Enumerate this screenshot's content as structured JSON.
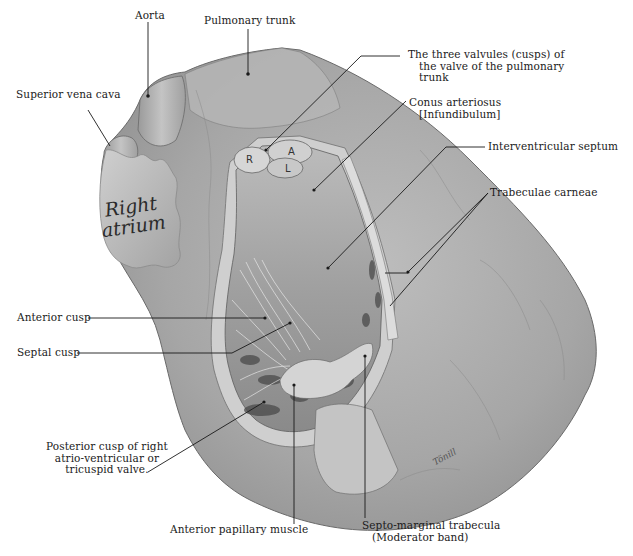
{
  "figure": {
    "colors": {
      "background": "#ffffff",
      "heart_surface": "#a9a9a9",
      "heart_light": "#c8c8c8",
      "heart_dark": "#6e6e6e",
      "cavity": "#8a8a8a",
      "label_text": "#1a1a1a",
      "leader_line": "#1a1a1a"
    }
  },
  "labels": {
    "aorta": "Aorta",
    "pulmonary_trunk": "Pulmonary trunk",
    "superior_vena_cava": "Superior vena cava",
    "valvules": [
      "The three valvules (cusps) of",
      "the valve of the pulmonary",
      "trunk"
    ],
    "conus": [
      "Conus arteriosus",
      "[Infundibulum]"
    ],
    "interventricular_septum": "Interventricular septum",
    "trabeculae_carneae": "Trabeculae carneae",
    "anterior_cusp": "Anterior cusp",
    "septal_cusp": "Septal cusp",
    "posterior_cusp": [
      "Posterior cusp of right",
      "atrio-ventricular or",
      "tricuspid valve."
    ],
    "anterior_papillary_muscle": "Anterior papillary muscle",
    "septo_marginal": [
      "Septo-marginal trabecula",
      "(Moderator band)"
    ]
  },
  "inline_text": {
    "right_atrium": [
      "Right",
      "atrium"
    ],
    "cusp_letters": [
      "R",
      "A",
      "L"
    ],
    "signature": "Tönill"
  }
}
